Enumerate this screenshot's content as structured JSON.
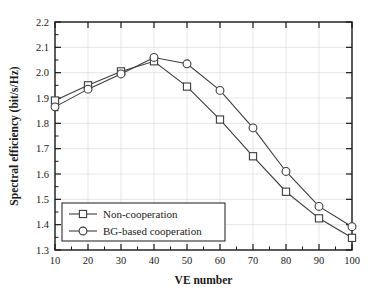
{
  "chart_data": {
    "type": "line",
    "title": "",
    "xlabel": "VE number",
    "ylabel": "Spectral efficiency (bit/s/Hz)",
    "x": [
      10,
      20,
      30,
      40,
      50,
      60,
      70,
      80,
      90,
      100
    ],
    "xlim": [
      10,
      100
    ],
    "ylim": [
      1.3,
      2.2
    ],
    "xticks": [
      "10",
      "20",
      "30",
      "40",
      "50",
      "60",
      "70",
      "80",
      "90",
      "100"
    ],
    "yticks": [
      "1.3",
      "1.4",
      "1.5",
      "1.6",
      "1.7",
      "1.8",
      "1.9",
      "2.0",
      "2.1",
      "2.2"
    ],
    "grid": true,
    "minor_ticks": true,
    "legend_position": "bottom-left",
    "series": [
      {
        "name": "Non-cooperation",
        "marker": "square",
        "color": "#3c3c3c",
        "values": [
          1.89,
          1.95,
          2.005,
          2.045,
          1.945,
          1.815,
          1.67,
          1.53,
          1.425,
          1.348
        ]
      },
      {
        "name": "BG-based cooperation",
        "marker": "circle",
        "color": "#3c3c3c",
        "values": [
          1.865,
          1.935,
          1.995,
          2.06,
          2.035,
          1.93,
          1.782,
          1.61,
          1.472,
          1.392
        ]
      }
    ]
  },
  "legend": {
    "items": [
      {
        "label": "Non-cooperation",
        "marker": "square"
      },
      {
        "label": "BG-based cooperation",
        "marker": "circle"
      }
    ]
  }
}
